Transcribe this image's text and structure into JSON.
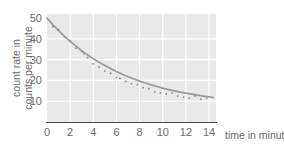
{
  "chart_data": {
    "type": "scatter",
    "title": "",
    "subtitle": "",
    "xlabel": "time in minutes",
    "ylabel": "count rate in counts per minute",
    "ylabel_line1": "count rate in",
    "ylabel_line2": "counts per minute",
    "xlim": [
      0,
      14.6
    ],
    "ylim": [
      0,
      52
    ],
    "xticks": [
      0,
      2,
      4,
      6,
      8,
      10,
      12,
      14
    ],
    "xtick_labels": [
      "0",
      "2",
      "4",
      "6",
      "8",
      "10",
      "12",
      "14"
    ],
    "yticks": [
      10,
      20,
      30,
      40,
      50
    ],
    "ytick_labels": [
      "10",
      "20",
      "30",
      "40",
      "50"
    ],
    "grid": true,
    "grid_color": "#ffffff",
    "plot_background": "#e9e9e9",
    "legend": null,
    "legend_position": "none",
    "series": [
      {
        "name": "measured count rate",
        "type": "scatter",
        "marker": "point",
        "color": "#8f8f8f",
        "x": [
          0.5,
          1.0,
          1.5,
          2.0,
          2.5,
          3.0,
          3.2,
          3.5,
          4.0,
          4.5,
          5.0,
          5.5,
          6.0,
          6.3,
          6.8,
          7.3,
          7.8,
          8.3,
          8.8,
          9.3,
          9.8,
          10.3,
          10.8,
          11.3,
          11.8,
          12.3,
          12.8,
          13.3,
          13.8
        ],
        "y": [
          46.0,
          44.5,
          41.0,
          39.0,
          35.5,
          34.0,
          33.0,
          31.0,
          28.0,
          26.5,
          24.5,
          23.5,
          21.5,
          21.0,
          19.5,
          18.5,
          18.0,
          16.5,
          16.0,
          14.5,
          14.0,
          13.5,
          14.0,
          12.5,
          12.0,
          11.5,
          12.5,
          11.0,
          11.5
        ]
      },
      {
        "name": "fitted decay curve",
        "type": "line",
        "color": "#9a9a9a",
        "x": [
          0,
          0.5,
          1,
          1.5,
          2,
          2.5,
          3,
          3.5,
          4,
          4.5,
          5,
          5.5,
          6,
          6.5,
          7,
          7.5,
          8,
          8.5,
          9,
          9.5,
          10,
          10.5,
          11,
          11.5,
          12,
          12.5,
          13,
          13.5,
          14,
          14.4
        ],
        "y": [
          50.0,
          46.9,
          44.0,
          41.3,
          38.8,
          36.5,
          34.3,
          32.3,
          30.5,
          28.8,
          27.2,
          25.7,
          24.3,
          23.0,
          21.8,
          20.7,
          19.7,
          18.8,
          17.9,
          17.1,
          16.3,
          15.6,
          15.0,
          14.4,
          13.9,
          13.4,
          12.9,
          12.5,
          12.1,
          11.8
        ]
      }
    ]
  }
}
